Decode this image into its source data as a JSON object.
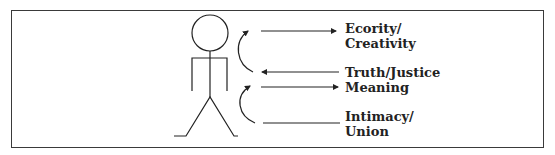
{
  "figure": {
    "border_color": "#3a3a3a",
    "line_color": "#222222",
    "labels": [
      {
        "id": "ecority",
        "line1": "Ecority/",
        "line2": "Creativity"
      },
      {
        "id": "truth",
        "line1": "Truth/Justice",
        "line2": "Meaning"
      },
      {
        "id": "intimacy",
        "line1": "Intimacy/",
        "line2": "Union"
      }
    ]
  }
}
